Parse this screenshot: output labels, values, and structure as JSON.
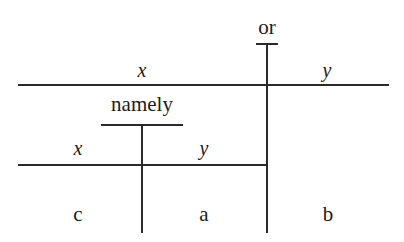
{
  "diagram": {
    "type": "split-tree",
    "top_split": {
      "operator": "or",
      "left_label": "x",
      "right_label": "y"
    },
    "sub_split": {
      "operator": "namely",
      "left_label": "x",
      "right_label": "y"
    },
    "leaves": [
      "c",
      "a",
      "b"
    ]
  }
}
